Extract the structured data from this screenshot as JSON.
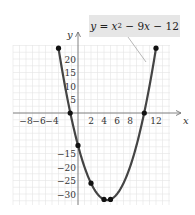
{
  "chart_data": {
    "type": "line",
    "title": "",
    "equation_label": "y = x² − 9x − 12",
    "xlabel": "x",
    "ylabel": "y",
    "xlim": [
      -10,
      14
    ],
    "ylim": [
      -35,
      25
    ],
    "x_ticks": [
      -8,
      -6,
      -4,
      2,
      4,
      6,
      8,
      12
    ],
    "x_tick_labels": [
      "−8",
      "−6",
      "−4",
      "2",
      "4",
      "6",
      "8",
      "12"
    ],
    "y_ticks": [
      20,
      15,
      10,
      5,
      -15,
      -20,
      -25,
      -30
    ],
    "y_tick_labels": [
      "20",
      "15",
      "10",
      "5",
      "−15",
      "−20",
      "−25",
      "−30"
    ],
    "grid": true,
    "series": [
      {
        "name": "y = x^2 - 9x - 12",
        "function": "x^2 - 9x - 12",
        "domain": [
          -3,
          12
        ],
        "color": "#444444"
      }
    ],
    "marked_points": [
      {
        "x": -3,
        "y": 24
      },
      {
        "x": -1.2,
        "y": 0
      },
      {
        "x": 0,
        "y": -12
      },
      {
        "x": 2,
        "y": -26
      },
      {
        "x": 4,
        "y": -32
      },
      {
        "x": 5,
        "y": -32
      },
      {
        "x": 10.2,
        "y": 0
      },
      {
        "x": 12,
        "y": 24
      }
    ]
  },
  "labels": {
    "eq_y": "y",
    "eq_eq": " = ",
    "eq_x": "x",
    "eq_sup": "2",
    "eq_rest1": " − 9",
    "eq_x2": "x",
    "eq_rest2": " − 12"
  }
}
